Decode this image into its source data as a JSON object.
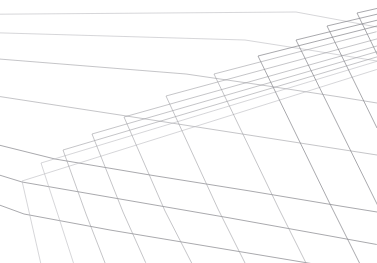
{
  "scene": {
    "title": "Perspective Ground Plane Wireframe Grid",
    "description": "A two-family wireframe mesh projected in linear perspective onto a receding ground plane, drawn as thin light-gray strokes on a plain white background. No text, labels, axes or interface chrome are present.",
    "kind": "perspective-grid",
    "width": 377,
    "height": 263
  },
  "canvas": {
    "background_color": "#ffffff",
    "width": 377,
    "height": 263
  },
  "style": {
    "line_color": "#9c9ca1",
    "line_color_faint": "#b9b9be",
    "line_color_strong": "#86868c",
    "line_width": 0.62,
    "line_width_strong": 0.75,
    "opacity": 0.95
  },
  "geometry": {
    "projection": "two-point-linear-perspective",
    "horizon_y": -34,
    "vanishing_point_rows": {
      "x": -512,
      "y": 18
    },
    "vanishing_point_columns": {
      "x": 1075,
      "y": -150
    },
    "row_count": 7,
    "column_count": 11,
    "extent": {
      "x_min": 18,
      "x_max": 377,
      "y_min": 11,
      "y_max": 250
    },
    "empty_region": "upper-left"
  },
  "chart_data": {
    "type": "line",
    "subtitle": "",
    "xlabel": "",
    "ylabel": "",
    "xlim": [
      0,
      377
    ],
    "ylim": [
      0,
      263
    ],
    "grid": false,
    "legend": false,
    "legend_position": "none",
    "annotations": [],
    "series": [
      {
        "name": "row-0",
        "family": "rows",
        "points": [
          [
            296,
            12
          ],
          [
            377,
            27
          ]
        ]
      },
      {
        "name": "row-1",
        "family": "rows",
        "points": [
          [
            245,
            40
          ],
          [
            309,
            50
          ],
          [
            377,
            61
          ]
        ]
      },
      {
        "name": "row-2",
        "family": "rows",
        "points": [
          [
            186,
            74
          ],
          [
            268,
            86
          ],
          [
            340,
            97
          ],
          [
            377,
            103
          ]
        ]
      },
      {
        "name": "row-3",
        "family": "rows",
        "points": [
          [
            120,
            115
          ],
          [
            210,
            129
          ],
          [
            300,
            143
          ],
          [
            377,
            155
          ]
        ]
      },
      {
        "name": "row-4",
        "family": "rows",
        "points": [
          [
            55,
            159
          ],
          [
            150,
            175
          ],
          [
            250,
            191
          ],
          [
            340,
            206
          ],
          [
            377,
            212
          ]
        ]
      },
      {
        "name": "row-5",
        "family": "rows",
        "points": [
          [
            22,
            182
          ],
          [
            120,
            199
          ],
          [
            230,
            218
          ],
          [
            330,
            236
          ],
          [
            363,
            242
          ]
        ]
      },
      {
        "name": "row-6",
        "family": "rows",
        "points": [
          [
            24,
            214
          ],
          [
            110,
            230
          ],
          [
            200,
            245
          ]
        ]
      },
      {
        "name": "col-0",
        "family": "columns",
        "points": [
          [
            22,
            181
          ],
          [
            30,
            216
          ],
          [
            35,
            238
          ]
        ]
      },
      {
        "name": "col-1",
        "family": "columns",
        "points": [
          [
            41,
            163
          ],
          [
            58,
            215
          ],
          [
            68,
            246
          ]
        ]
      },
      {
        "name": "col-2",
        "family": "columns",
        "points": [
          [
            63,
            150
          ],
          [
            86,
            214
          ],
          [
            100,
            250
          ]
        ]
      },
      {
        "name": "col-3",
        "family": "columns",
        "points": [
          [
            92,
            134
          ],
          [
            123,
            212
          ],
          [
            140,
            250
          ]
        ]
      },
      {
        "name": "col-4",
        "family": "columns",
        "points": [
          [
            124,
            117
          ],
          [
            165,
            211
          ],
          [
            185,
            250
          ]
        ]
      },
      {
        "name": "col-5",
        "family": "columns",
        "points": [
          [
            166,
            96
          ],
          [
            218,
            209
          ],
          [
            238,
            249
          ]
        ]
      },
      {
        "name": "col-6",
        "family": "columns",
        "points": [
          [
            214,
            74
          ],
          [
            278,
            207
          ],
          [
            296,
            243
          ]
        ]
      },
      {
        "name": "col-7",
        "family": "columns",
        "points": [
          [
            258,
            56
          ],
          [
            330,
            204
          ],
          [
            353,
            250
          ]
        ]
      },
      {
        "name": "col-8",
        "family": "columns",
        "points": [
          [
            296,
            40
          ],
          [
            377,
            204
          ]
        ]
      },
      {
        "name": "col-9",
        "family": "columns",
        "points": [
          [
            327,
            26
          ],
          [
            377,
            128
          ]
        ]
      },
      {
        "name": "col-10",
        "family": "columns",
        "points": [
          [
            357,
            13
          ],
          [
            377,
            54
          ]
        ]
      }
    ]
  }
}
